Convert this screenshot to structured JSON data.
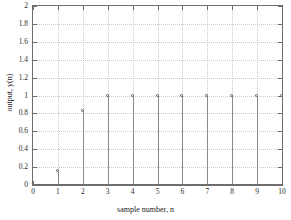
{
  "chart_data": {
    "type": "bar",
    "plot_style": "stem",
    "title": "",
    "xlabel": "sample number, n",
    "ylabel": "output, y(n)",
    "x": [
      1,
      2,
      3,
      4,
      5,
      6,
      7,
      8,
      9,
      10
    ],
    "values": [
      0.16,
      0.83,
      1.0,
      1.0,
      1.0,
      1.0,
      1.0,
      1.0,
      1.0,
      1.0
    ],
    "categories": [
      "1",
      "2",
      "3",
      "4",
      "5",
      "6",
      "7",
      "8",
      "9",
      "10"
    ],
    "xlim": [
      0,
      10
    ],
    "ylim": [
      0,
      2
    ],
    "xticks": [
      0,
      1,
      2,
      3,
      4,
      5,
      6,
      7,
      8,
      9,
      10
    ],
    "xticklabels": [
      "0",
      "1",
      "2",
      "3",
      "4",
      "5",
      "6",
      "7",
      "8",
      "9",
      "10"
    ],
    "yticks": [
      0,
      0.2,
      0.4,
      0.6,
      0.8,
      1,
      1.2,
      1.4,
      1.6,
      1.8,
      2
    ],
    "yticklabels": [
      "0",
      "0.2",
      "0.4",
      "0.6",
      "0.8",
      "1",
      "1.2",
      "1.4",
      "1.6",
      "1.8",
      "2"
    ],
    "grid": true,
    "legend": null,
    "legend_position": "none",
    "marker": "open-circle",
    "colors": {
      "axis": "#6e6e6e",
      "grid": "#c9c9c9",
      "stem": "#8a8a8a",
      "marker_edge": "#555555",
      "background": "#ffffff",
      "text": "#1a1a1a"
    }
  }
}
